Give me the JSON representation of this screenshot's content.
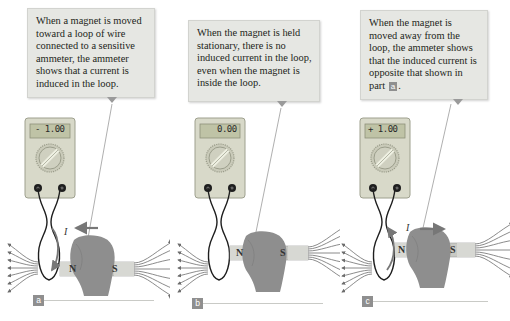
{
  "panels": [
    {
      "id": "a",
      "label": "a",
      "caption": "When a magnet is moved toward a loop of wire connected to a sensitive ammeter, the ammeter shows that a current is induced in the loop.",
      "meter_reading": "- 1.00",
      "current_symbol": "I",
      "motion": "toward-loop",
      "magnet_poles": {
        "north": "N",
        "south": "S"
      }
    },
    {
      "id": "b",
      "label": "b",
      "caption": "When the magnet is held stationary, there is no induced current in the loop, even when the magnet is inside the loop.",
      "meter_reading": "0.00",
      "motion": "stationary",
      "magnet_poles": {
        "north": "N",
        "south": "S"
      }
    },
    {
      "id": "c",
      "label": "c",
      "caption_before": "When the magnet is moved away from the loop, the ammeter shows that the induced current is opposite that shown in part",
      "caption_ref": "a",
      "caption_after": ".",
      "meter_reading": "+ 1.00",
      "current_symbol": "I",
      "motion": "away-from-loop",
      "magnet_poles": {
        "north": "N",
        "south": "S"
      }
    }
  ],
  "colors": {
    "callout_bg": "#e6e7e3",
    "meter_body": "#d8d9c9",
    "meter_display": "#bfc3a6",
    "hand": "#8e8e8e",
    "field_lines": "#6d6d6d",
    "arrow": "#7a7a7a",
    "label_bg": "#8f8f8f"
  }
}
